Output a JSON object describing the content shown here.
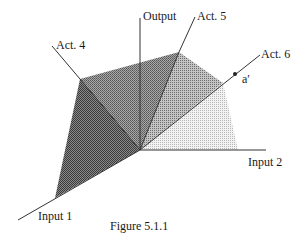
{
  "figure": {
    "caption": "Figure 5.1.1",
    "axes": {
      "input1": "Input 1",
      "input2": "Input 2",
      "output": "Output"
    },
    "activities": {
      "act4": "Act. 4",
      "act5": "Act. 5",
      "act6": "Act. 6"
    },
    "point_label": "a′",
    "colors": {
      "darkest": "#5a5a5a",
      "dark": "#7a7a7a",
      "medium": "#959595",
      "light": "#dcdcdc",
      "line": "#333333"
    }
  }
}
